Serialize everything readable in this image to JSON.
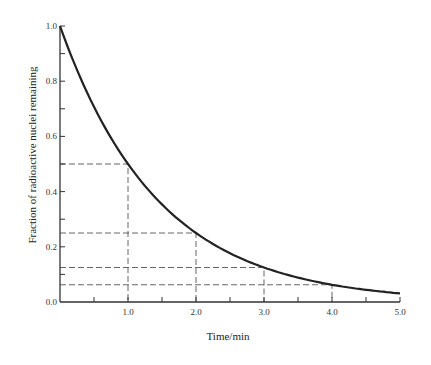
{
  "chart_data": {
    "type": "line",
    "title": "",
    "xlabel": "Time/min",
    "ylabel": "Fraction of radioactive nuclei remaining",
    "xlim": [
      0,
      5.0
    ],
    "ylim": [
      0,
      1.0
    ],
    "grid": false,
    "legend": null,
    "x_ticks": [
      "1.0",
      "2.0",
      "3.0",
      "4.0",
      "5.0"
    ],
    "y_ticks": [
      "0.0",
      "0.2",
      "0.4",
      "0.6",
      "0.8",
      "1.0"
    ],
    "series": [
      {
        "name": "decay curve",
        "x": [
          0,
          0.5,
          1.0,
          1.5,
          2.0,
          2.5,
          3.0,
          3.5,
          4.0,
          4.5,
          5.0
        ],
        "values": [
          1.0,
          0.707,
          0.5,
          0.354,
          0.25,
          0.177,
          0.125,
          0.088,
          0.0625,
          0.044,
          0.031
        ]
      }
    ],
    "annotations": [
      {
        "type": "dashed-guide",
        "x": 1.0,
        "y": 0.5
      },
      {
        "type": "dashed-guide",
        "x": 2.0,
        "y": 0.25
      },
      {
        "type": "dashed-guide",
        "x": 3.0,
        "y": 0.125
      },
      {
        "type": "dashed-guide",
        "x": 4.0,
        "y": 0.0625
      }
    ],
    "colors": {
      "curve": "#222222",
      "axis": "#333333",
      "guide": "#555555"
    }
  }
}
